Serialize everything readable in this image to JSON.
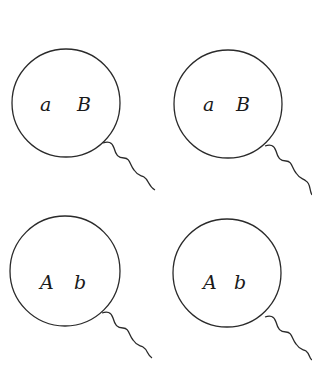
{
  "figure": {
    "cells": [
      {
        "id": "top-left",
        "alleles": [
          "a",
          "B"
        ]
      },
      {
        "id": "top-right",
        "alleles": [
          "a",
          "B"
        ]
      },
      {
        "id": "bottom-left",
        "alleles": [
          "A",
          "b"
        ]
      },
      {
        "id": "bottom-right",
        "alleles": [
          "A",
          "b"
        ]
      }
    ]
  }
}
